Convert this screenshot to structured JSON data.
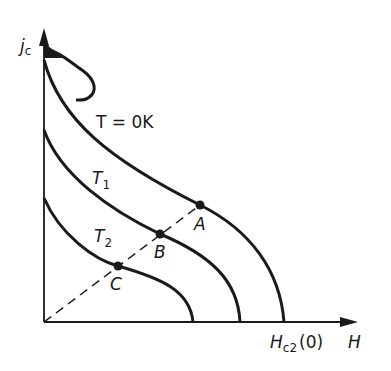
{
  "diagram": {
    "axes": {
      "y_label": "j",
      "y_label_sub": "c",
      "x_label": "H",
      "x_tick_label_main": "H",
      "x_tick_label_sub": "c2",
      "x_tick_label_suffix": "(0)"
    },
    "curves": [
      {
        "label": "T = 0K",
        "label_main": "T = 0K"
      },
      {
        "label": "T1",
        "label_main": "T",
        "label_sub": "1"
      },
      {
        "label": "T2",
        "label_main": "T",
        "label_sub": "2"
      }
    ],
    "points": [
      {
        "label": "A"
      },
      {
        "label": "B"
      },
      {
        "label": "C"
      }
    ],
    "line_color": "#1a1a1a",
    "background": "#ffffff"
  }
}
